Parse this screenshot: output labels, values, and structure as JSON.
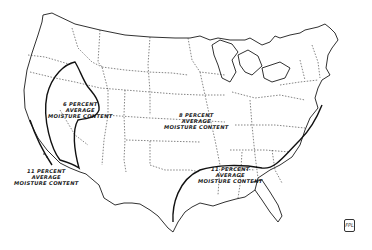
{
  "map": {
    "subject": "Average moisture content zones, contiguous United States",
    "zones": [
      {
        "id": "west",
        "line1": "6 PERCENT",
        "line2": "AVERAGE",
        "line3": "MOISTURE CONTENT"
      },
      {
        "id": "central",
        "line1": "8 PERCENT",
        "line2": "AVERAGE",
        "line3": "MOISTURE CONTENT"
      },
      {
        "id": "southeast",
        "line1": "11 PERCENT",
        "line2": "AVERAGE",
        "line3": "MOISTURE CONTENT"
      },
      {
        "id": "coast",
        "line1": "11 PERCENT",
        "line2": "AVERAGE",
        "line3": "MOISTURE CONTENT"
      }
    ],
    "stamp": "FPL",
    "colors": {
      "ink": "#1a1a1a",
      "background": "#ffffff"
    }
  }
}
